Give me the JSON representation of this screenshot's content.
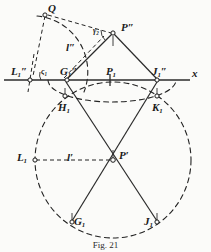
{
  "figure": {
    "caption": "Fig. 21",
    "axis_label": "x",
    "colors": {
      "ink": "#1a1a1a",
      "line": "#2b2b2b",
      "paper": "#fbfbf9"
    },
    "points": [
      {
        "id": "Q",
        "base": "Q",
        "sub": "",
        "prime": "",
        "x": 45,
        "y": 14,
        "lx": 48,
        "ly": 3,
        "marker": true
      },
      {
        "id": "Ppp",
        "base": "P",
        "sub": "",
        "prime": "″",
        "x": 113,
        "y": 33,
        "lx": 121,
        "ly": 22,
        "marker": true
      },
      {
        "id": "L1pp",
        "base": "L",
        "sub": "1",
        "prime": "″",
        "x": 30,
        "y": 80,
        "lx": 11,
        "ly": 66,
        "marker": true
      },
      {
        "id": "G1pp",
        "base": "G",
        "sub": "1",
        "prime": "″",
        "x": 67,
        "y": 80,
        "lx": 60,
        "ly": 66,
        "marker": true
      },
      {
        "id": "P1",
        "base": "P",
        "sub": "1",
        "prime": "",
        "x": 110,
        "y": 80,
        "lx": 106,
        "ly": 66,
        "marker": false
      },
      {
        "id": "J1pp",
        "base": "J",
        "sub": "1",
        "prime": "″",
        "x": 157,
        "y": 80,
        "lx": 152,
        "ly": 66,
        "marker": true
      },
      {
        "id": "H1",
        "base": "H",
        "sub": "1",
        "prime": "",
        "x": 65,
        "y": 97,
        "lx": 58,
        "ly": 102,
        "marker": true
      },
      {
        "id": "K1",
        "base": "K",
        "sub": "1",
        "prime": "",
        "x": 157,
        "y": 97,
        "lx": 152,
        "ly": 102,
        "marker": true
      },
      {
        "id": "L1",
        "base": "L",
        "sub": "1",
        "prime": "",
        "x": 35,
        "y": 160,
        "lx": 17,
        "ly": 152,
        "marker": true
      },
      {
        "id": "Pp",
        "base": "P",
        "sub": "",
        "prime": "′",
        "x": 113,
        "y": 160,
        "lx": 119,
        "ly": 150,
        "marker": true
      },
      {
        "id": "G1b",
        "base": "G",
        "sub": "1",
        "prime": "",
        "x": 72,
        "y": 222,
        "lx": 74,
        "ly": 216,
        "marker": true
      },
      {
        "id": "J1b",
        "base": "J",
        "sub": "1",
        "prime": "",
        "x": 157,
        "y": 222,
        "lx": 144,
        "ly": 216,
        "marker": true
      }
    ],
    "segment_labels": [
      {
        "id": "l-pp",
        "text": "l″",
        "x": 66,
        "y": 42
      },
      {
        "id": "l-p",
        "text": "l′",
        "x": 67,
        "y": 152
      }
    ],
    "angle_labels": [
      {
        "id": "gamma-2",
        "text": "γ₂",
        "x": 93,
        "y": 27
      },
      {
        "id": "sigma-1",
        "text": "ς₁",
        "x": 41,
        "y": 68
      }
    ]
  }
}
